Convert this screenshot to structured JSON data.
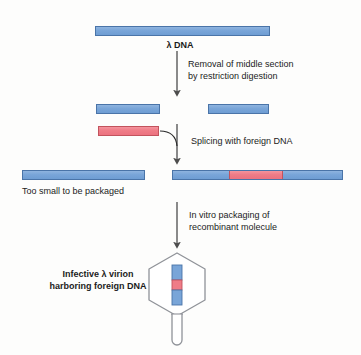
{
  "figure": {
    "colors": {
      "dna_blue_fill": "#79a5d8",
      "dna_blue_stroke": "#4a74a8",
      "foreign_red_fill": "#ef7c87",
      "foreign_red_stroke": "#c2535d",
      "arrow": "#4d4d4d",
      "phage_outline": "#8d8f96",
      "text": "#1b1b1b",
      "background": "#fdfdfc"
    }
  },
  "labels": {
    "lambda_dna": "λ DNA",
    "step1": "Removal of middle section\nby restriction digestion",
    "step2": "Splicing with foreign DNA",
    "step3": "In vitro packaging of\nrecombinant molecule",
    "too_small": "Too small to be packaged",
    "virion": "Infective λ virion\nharboring foreign DNA"
  },
  "elements": {
    "full_lambda_dna": {
      "name": "full-length lambda DNA",
      "color": "blue"
    },
    "left_arm": {
      "name": "left arm fragment",
      "color": "blue"
    },
    "right_arm": {
      "name": "right arm fragment",
      "color": "blue"
    },
    "foreign_dna": {
      "name": "foreign DNA fragment",
      "color": "red"
    },
    "too_small_molecule": {
      "name": "religated arms without insert",
      "color": "blue"
    },
    "recombinant_molecule": {
      "name": "recombinant lambda molecule",
      "segments": [
        "blue",
        "red",
        "blue"
      ]
    },
    "virion": {
      "name": "infective lambda virion",
      "head_shape": "hexagon",
      "tail_shape": "tube",
      "packaged_dna_segments": [
        "blue",
        "red",
        "blue"
      ]
    }
  }
}
